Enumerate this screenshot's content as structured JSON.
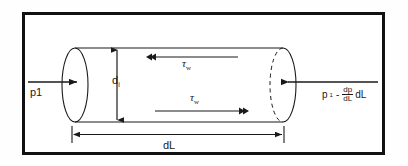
{
  "figure": {
    "type": "engineering-diagram",
    "frame": {
      "border_color": "#111111",
      "background_color": "#ffffff"
    },
    "line_color": "#1a1a1a",
    "labels": {
      "inlet_pressure": "p1",
      "diameter": "d",
      "diameter_subscript": "i",
      "tau_top_symbol": "τ",
      "tau_top_subscript": "w",
      "tau_bottom_symbol": "τ",
      "tau_bottom_subscript": "w",
      "length": "dL",
      "outlet_p": "p",
      "outlet_p_subscript": "1",
      "outlet_minus": "-",
      "outlet_frac_numerator": "dp",
      "outlet_frac_denominator": "dL",
      "outlet_trailing": "dL"
    },
    "annotations": {
      "inlet_arrow_direction": "right",
      "outlet_arrow_direction": "left",
      "tau_top_arrow_direction": "left",
      "tau_bottom_arrow_direction": "right",
      "diameter_arrow_style": "double-headed-vertical",
      "length_arrow_style": "double-headed-horizontal-with-end-ticks",
      "left_cap_style": "solid-ellipse",
      "right_cap_style": "solid-right-arc-dashed-left-arc"
    }
  }
}
